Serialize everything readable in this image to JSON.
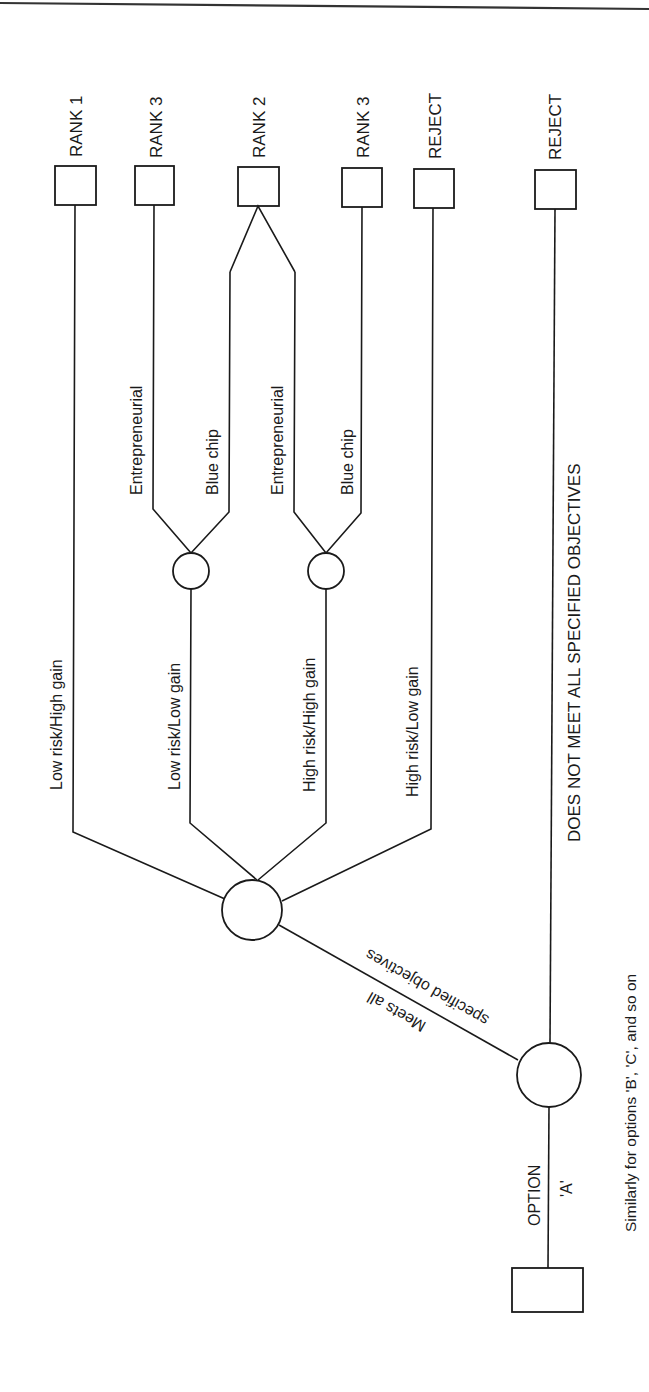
{
  "diagram": {
    "type": "decision-tree",
    "orientation": "rotated-90-ccw",
    "root": {
      "label_line1": "OPTION",
      "label_line2": "'A'"
    },
    "first_chance": {
      "branch_meets": {
        "label_line1": "Meets all",
        "label_line2": "specified objectives"
      },
      "branch_fails": {
        "label": "DOES NOT MEET ALL SPECIFIED OBJECTIVES",
        "outcome": "REJECT"
      }
    },
    "second_chance": {
      "branches": [
        {
          "label": "Low risk/High gain",
          "outcome": "RANK 1"
        },
        {
          "label": "Low risk/Low gain",
          "sub_branches": [
            {
              "label": "Entrepreneurial",
              "outcome": "RANK 3"
            },
            {
              "label": "Blue chip",
              "outcome": "RANK 2"
            }
          ]
        },
        {
          "label": "High risk/High gain",
          "sub_branches": [
            {
              "label": "Entrepreneurial",
              "outcome": "RANK 2"
            },
            {
              "label": "Blue chip",
              "outcome": "RANK 3"
            }
          ]
        },
        {
          "label": "High risk/Low gain",
          "outcome": "REJECT"
        }
      ]
    },
    "outcomes": [
      "RANK 1",
      "RANK 3",
      "RANK 2",
      "RANK 3",
      "REJECT",
      "REJECT"
    ],
    "caption": "Similarly for options 'B', 'C', and so on"
  }
}
